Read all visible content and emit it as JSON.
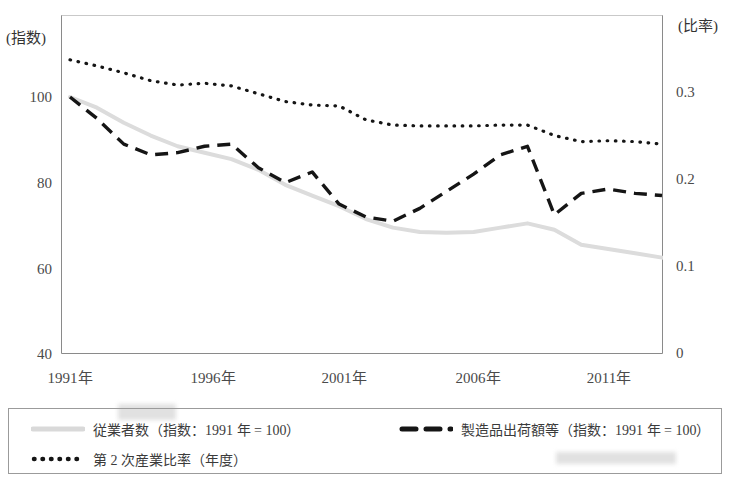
{
  "axes": {
    "left_title": "(指数)",
    "right_title": "(比率)",
    "left_ticks": [
      "100",
      "80",
      "60",
      "40"
    ],
    "right_ticks": [
      "0.3",
      "0.2",
      "0.1",
      "0"
    ],
    "x_ticks": [
      "1991年",
      "1996年",
      "2001年",
      "2006年",
      "2011年"
    ]
  },
  "legend": {
    "employees": "従業者数（指数：1991 年 = 100）",
    "shipment": "製造品出荷額等（指数：1991 年 = 100）",
    "ratio": "第 2 次産業比率（年度）"
  },
  "colors": {
    "employees": "#d6d6d6",
    "shipment": "#1a1a1a",
    "ratio": "#1a1a1a",
    "frame": "#8a8a8a",
    "text": "#3a3a3a"
  },
  "chart_data": {
    "type": "line",
    "title": "",
    "xlabel": "",
    "ylabel": "指数",
    "y2label": "比率",
    "ylim": [
      40,
      110
    ],
    "y2lim": [
      0,
      0.35
    ],
    "xlim": [
      1991,
      2013
    ],
    "grid": false,
    "legend_position": "bottom",
    "x": [
      1991,
      1992,
      1993,
      1994,
      1995,
      1996,
      1997,
      1998,
      1999,
      2000,
      2001,
      2002,
      2003,
      2004,
      2005,
      2006,
      2007,
      2008,
      2009,
      2010,
      2011,
      2012,
      2013
    ],
    "series": [
      {
        "name": "従業者数（指数：1991 年 = 100）",
        "axis": "left",
        "style": "solid-thick-gray",
        "values": [
          100.0,
          97.5,
          94.0,
          91.0,
          88.5,
          87.0,
          85.5,
          83.0,
          79.5,
          77.0,
          74.5,
          71.5,
          69.5,
          68.5,
          68.3,
          68.5,
          69.5,
          70.5,
          69.0,
          65.5,
          64.5,
          63.5,
          62.5
        ]
      },
      {
        "name": "製造品出荷額等（指数：1991 年 = 100）",
        "axis": "left",
        "style": "dashed-black",
        "values": [
          100.0,
          95.0,
          89.0,
          86.5,
          87.0,
          88.5,
          89.0,
          83.5,
          80.0,
          82.5,
          75.0,
          72.0,
          71.0,
          74.0,
          78.0,
          82.0,
          86.5,
          88.5,
          72.5,
          77.5,
          78.5,
          77.5,
          77.0
        ]
      },
      {
        "name": "第 2 次産業比率（年度）",
        "axis": "right",
        "style": "dotted-black",
        "values": [
          0.337,
          0.33,
          0.322,
          0.313,
          0.308,
          0.31,
          0.307,
          0.298,
          0.289,
          0.285,
          0.284,
          0.268,
          0.262,
          0.261,
          0.261,
          0.261,
          0.262,
          0.262,
          0.25,
          0.243,
          0.244,
          0.243,
          0.24
        ]
      }
    ]
  }
}
